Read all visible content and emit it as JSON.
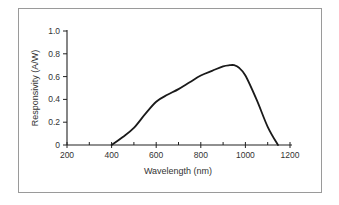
{
  "chart_data": {
    "type": "line",
    "title": "",
    "xlabel": "Wavelength (nm)",
    "ylabel": "Responsivity (A/W)",
    "xlim": [
      200,
      1200
    ],
    "ylim": [
      0,
      1.0
    ],
    "grid": false,
    "legend": null,
    "x_ticks": [
      200,
      400,
      600,
      800,
      1000,
      1200
    ],
    "x_tick_labels": [
      "200",
      "400",
      "600",
      "800",
      "1000",
      "1200"
    ],
    "x_minor_ticks": [
      300,
      500,
      700,
      900,
      1100
    ],
    "y_ticks": [
      0,
      0.2,
      0.4,
      0.6,
      0.8,
      1.0
    ],
    "y_tick_labels": [
      "0",
      "0.2",
      "0.4",
      "0.6",
      "0.8",
      "1.0"
    ],
    "series": [
      {
        "name": "Responsivity",
        "x": [
          400,
          450,
          500,
          550,
          600,
          650,
          700,
          750,
          800,
          850,
          900,
          930,
          950,
          970,
          1000,
          1050,
          1100,
          1146
        ],
        "values": [
          0,
          0.07,
          0.15,
          0.27,
          0.38,
          0.44,
          0.49,
          0.55,
          0.61,
          0.65,
          0.69,
          0.7,
          0.7,
          0.68,
          0.61,
          0.4,
          0.16,
          0
        ]
      }
    ]
  }
}
